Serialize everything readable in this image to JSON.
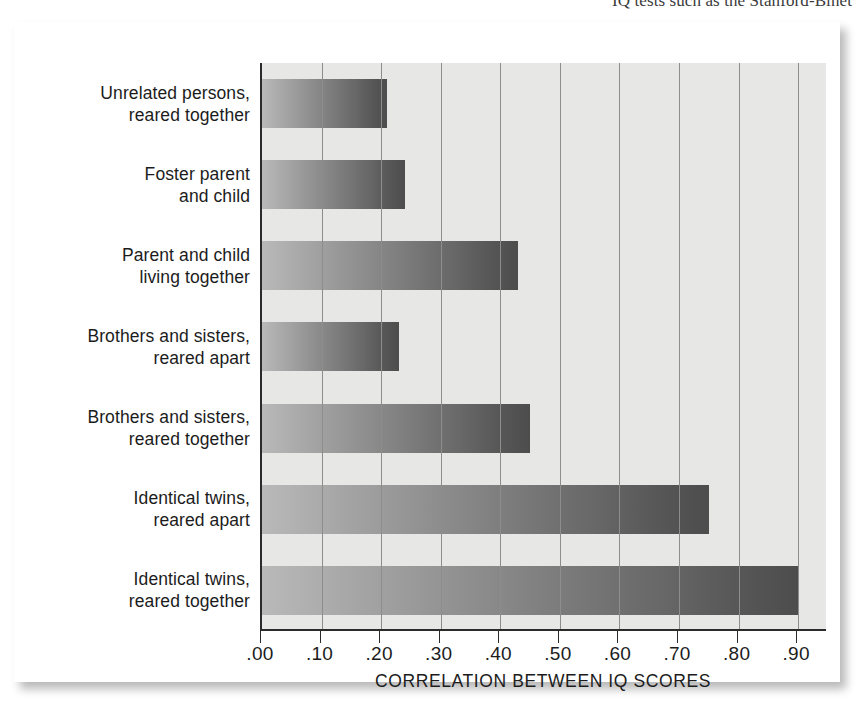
{
  "page": {
    "clipped_header_text": "IQ tests such as the Stanford-Binet"
  },
  "chart_data": {
    "type": "bar",
    "orientation": "horizontal",
    "title": "",
    "xlabel": "CORRELATION BETWEEN IQ SCORES",
    "ylabel": "",
    "xlim": [
      0.0,
      0.95
    ],
    "xticks": [
      0.0,
      0.1,
      0.2,
      0.3,
      0.4,
      0.5,
      0.6,
      0.7,
      0.8,
      0.9
    ],
    "xtick_labels": [
      ".00",
      ".10",
      ".20",
      ".30",
      ".40",
      ".50",
      ".60",
      ".70",
      ".80",
      ".90"
    ],
    "grid": "vertical",
    "legend": "none",
    "categories": [
      "Unrelated persons, reared together",
      "Foster parent and child",
      "Parent and child living together",
      "Brothers and sisters, reared apart",
      "Brothers and sisters, reared together",
      "Identical twins, reared apart",
      "Identical twins, reared together"
    ],
    "category_lines": [
      [
        "Unrelated persons,",
        "reared together"
      ],
      [
        "Foster parent",
        "and child"
      ],
      [
        "Parent and child",
        "living together"
      ],
      [
        "Brothers and sisters,",
        "reared apart"
      ],
      [
        "Brothers and sisters,",
        "reared together"
      ],
      [
        "Identical twins,",
        "reared apart"
      ],
      [
        "Identical twins,",
        "reared together"
      ]
    ],
    "values": [
      0.21,
      0.24,
      0.43,
      0.23,
      0.45,
      0.75,
      0.9
    ],
    "bar_color_start": "#b9b9b9",
    "bar_color_end": "#555555",
    "plot_background": "#e7e8e6",
    "gridline_color": "#8d8d8d",
    "axis_color": "#2b2b2b"
  }
}
